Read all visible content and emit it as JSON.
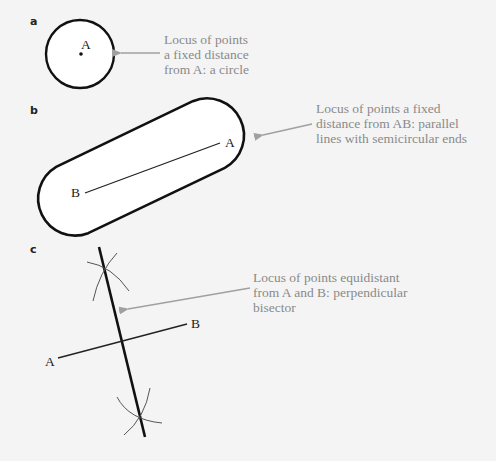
{
  "panels": {
    "a": {
      "label": "a",
      "point": "A",
      "caption": "Locus of points\na fixed distance\nfrom A: a circle"
    },
    "b": {
      "label": "b",
      "point_a": "A",
      "point_b": "B",
      "caption": "Locus of points a fixed\ndistance from AB: parallel\nlines with semicircular ends"
    },
    "c": {
      "label": "c",
      "point_a": "A",
      "point_b": "B",
      "caption": "Locus of points equidistant\nfrom A and B: perpendicular\nbisector"
    }
  },
  "colors": {
    "background": "#f4f4f4",
    "shape_stroke": "#111111",
    "shape_fill": "#ffffff",
    "arrow": "#a0a0a0",
    "caption_text": "#8a8a8a"
  }
}
